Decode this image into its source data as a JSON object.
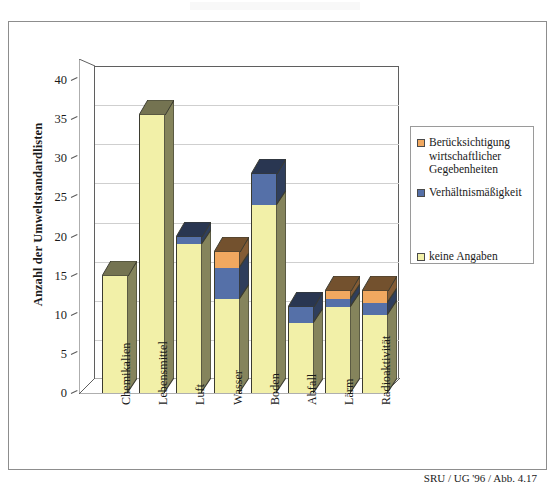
{
  "figure": {
    "caption": "SRU / UG '96 / Abb. 4.17"
  },
  "axes": {
    "ylabel": "Anzahl der Umweltstandardlisten",
    "yticks": [
      "40",
      "35",
      "30",
      "25",
      "20",
      "15",
      "10",
      "5",
      "0"
    ]
  },
  "legend": {
    "items": [
      {
        "label": "Berücksichtigung wirtschaftlicher Gegebenheiten",
        "color": "#f0a860"
      },
      {
        "label": "Verhältnismäßigkeit",
        "color": "#5570a8"
      },
      {
        "label": "keine Angaben",
        "color": "#f2f0a8"
      }
    ]
  },
  "chart_data": {
    "type": "bar",
    "stacked": true,
    "title": "",
    "xlabel": "",
    "ylabel": "Anzahl der Umweltstandardlisten",
    "ylim": [
      0,
      40
    ],
    "ytick_step": 5,
    "grid": true,
    "legend_position": "right",
    "categories": [
      "Chemikalien",
      "Lebensmittel",
      "Luft",
      "Wasser",
      "Boden",
      "Abfall",
      "Lärm",
      "Radioaktivität"
    ],
    "series": [
      {
        "name": "keine Angaben",
        "color": "#f2f0a8",
        "values": [
          15,
          35.5,
          19,
          12,
          24,
          9,
          11,
          10
        ]
      },
      {
        "name": "Verhältnismäßigkeit",
        "color": "#5570a8",
        "values": [
          0,
          0,
          1,
          4,
          4,
          2,
          1,
          1.5
        ]
      },
      {
        "name": "Berücksichtigung wirtschaftlicher Gegebenheiten",
        "color": "#f0a860",
        "values": [
          0,
          0,
          0,
          2,
          0,
          0,
          1,
          1.5
        ]
      }
    ],
    "totals": [
      15,
      35.5,
      20,
      18,
      28,
      11,
      13,
      13
    ]
  }
}
